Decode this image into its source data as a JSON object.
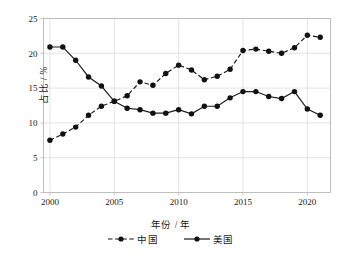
{
  "chart_data": {
    "type": "line",
    "title": "",
    "xlabel": "年份 / 年",
    "ylabel": "占比 / %",
    "xlim": [
      1999.5,
      2021.8
    ],
    "ylim": [
      0,
      25
    ],
    "yticks": [
      0,
      5,
      10,
      15,
      20,
      25
    ],
    "xticks": [
      2000,
      2005,
      2010,
      2015,
      2020
    ],
    "grid": true,
    "legend_position": "bottom",
    "x": [
      2000,
      2001,
      2002,
      2003,
      2004,
      2005,
      2006,
      2007,
      2008,
      2009,
      2010,
      2011,
      2012,
      2013,
      2014,
      2015,
      2016,
      2017,
      2018,
      2019,
      2020,
      2021
    ],
    "series": [
      {
        "name": "中国",
        "style": "dashed",
        "marker": "circle",
        "color": "#111111",
        "values": [
          7.5,
          8.4,
          9.4,
          11.1,
          12.4,
          13.1,
          13.9,
          15.9,
          15.4,
          17.1,
          18.3,
          17.6,
          16.2,
          16.7,
          17.7,
          20.4,
          20.6,
          20.3,
          20.0,
          20.8,
          22.6,
          22.3
        ]
      },
      {
        "name": "美国",
        "style": "solid",
        "marker": "circle",
        "color": "#111111",
        "values": [
          20.9,
          20.9,
          19.0,
          16.6,
          15.3,
          13.1,
          12.1,
          11.9,
          11.4,
          11.4,
          11.9,
          11.3,
          12.4,
          12.4,
          13.6,
          14.5,
          14.5,
          13.8,
          13.5,
          14.5,
          12.0,
          11.1
        ]
      }
    ]
  },
  "legend": {
    "items": [
      {
        "label": "中国",
        "style": "dashed"
      },
      {
        "label": "美国",
        "style": "solid"
      }
    ]
  }
}
